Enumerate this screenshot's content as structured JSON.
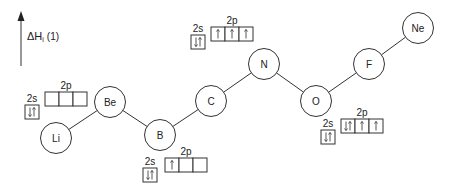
{
  "axis": {
    "label_main": "ΔH",
    "label_sub": "i",
    "label_suffix": "(1)",
    "direction": "up"
  },
  "elements": [
    {
      "symbol": "Li"
    },
    {
      "symbol": "Be"
    },
    {
      "symbol": "B"
    },
    {
      "symbol": "C"
    },
    {
      "symbol": "N"
    },
    {
      "symbol": "O"
    },
    {
      "symbol": "F"
    },
    {
      "symbol": "Ne"
    }
  ],
  "relative_ionization_order": [
    "Li",
    "B",
    "Be",
    "C",
    "O",
    "N",
    "F",
    "Ne"
  ],
  "orbital_diagrams": [
    {
      "element": "Be",
      "s_label": "2s",
      "p_label": "2p",
      "s": [
        "up-down"
      ],
      "p": [
        "",
        "",
        ""
      ]
    },
    {
      "element": "B",
      "s_label": "2s",
      "p_label": "2p",
      "s": [
        "up-down"
      ],
      "p": [
        "up",
        "",
        ""
      ]
    },
    {
      "element": "N",
      "s_label": "2s",
      "p_label": "2p",
      "s": [
        "up-down"
      ],
      "p": [
        "up",
        "up",
        "up"
      ]
    },
    {
      "element": "O",
      "s_label": "2s",
      "p_label": "2p",
      "s": [
        "up-down"
      ],
      "p": [
        "up-down",
        "up",
        "up"
      ]
    }
  ]
}
